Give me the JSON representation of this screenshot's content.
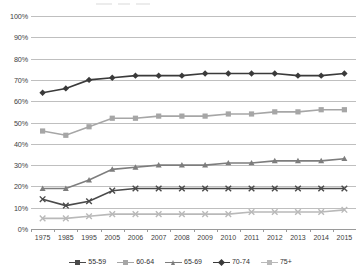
{
  "chart_data": {
    "type": "line",
    "title": "",
    "xlabel": "",
    "ylabel": "",
    "ylim": [
      0,
      100
    ],
    "ytick_labels": [
      "0%",
      "10%",
      "20%",
      "30%",
      "40%",
      "50%",
      "60%",
      "70%",
      "80%",
      "90%",
      "100%"
    ],
    "yticks": [
      0,
      10,
      20,
      30,
      40,
      50,
      60,
      70,
      80,
      90,
      100
    ],
    "grid": true,
    "legend_position": "bottom",
    "categories": [
      "1975",
      "1985",
      "1995",
      "2005",
      "2006",
      "2007",
      "2008",
      "2009",
      "2010",
      "2011",
      "2012",
      "2013",
      "2014",
      "2015"
    ],
    "series": [
      {
        "name": "55-59",
        "color": "#4a4a4a",
        "marker": "x",
        "values": [
          14,
          11,
          13,
          18,
          19,
          19,
          19,
          19,
          19,
          19,
          19,
          19,
          19,
          19
        ]
      },
      {
        "name": "60-64",
        "color": "#a6a6a6",
        "marker": "square",
        "values": [
          46,
          44,
          48,
          52,
          52,
          53,
          53,
          53,
          54,
          54,
          55,
          55,
          56,
          56
        ]
      },
      {
        "name": "65-69",
        "color": "#7d7d7d",
        "marker": "triangle",
        "values": [
          19,
          19,
          23,
          28,
          29,
          30,
          30,
          30,
          31,
          31,
          32,
          32,
          32,
          33
        ]
      },
      {
        "name": "70-74",
        "color": "#3a3a3a",
        "marker": "diamond",
        "values": [
          64,
          66,
          70,
          71,
          72,
          72,
          72,
          73,
          73,
          73,
          73,
          72,
          72,
          73
        ]
      },
      {
        "name": "75+",
        "color": "#b9b9b9",
        "marker": "x",
        "values": [
          5,
          5,
          6,
          7,
          7,
          7,
          7,
          7,
          7,
          8,
          8,
          8,
          8,
          9
        ]
      }
    ]
  }
}
